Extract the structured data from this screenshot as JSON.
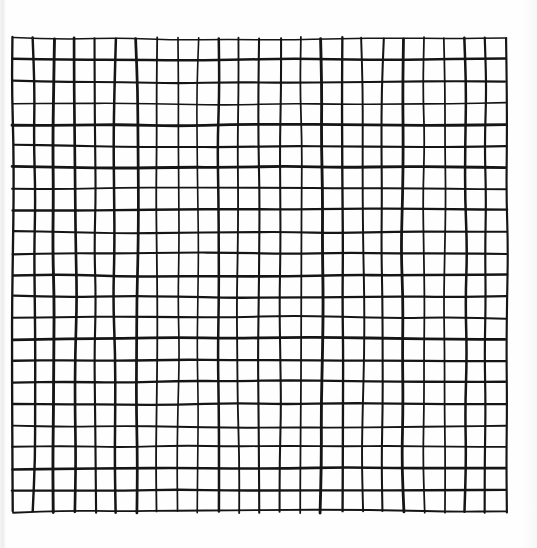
{
  "artwork": {
    "title": "Hand-drawn grid",
    "description": "A freehand ink drawing of a rectangular lattice of nearly-square cells on white paper",
    "medium": "ink on paper",
    "canvas": {
      "width": 537,
      "height": 548,
      "background_color": "#ffffff"
    },
    "paper": {
      "color": "#fefefe",
      "left_edge_shadow_color": "#e9e9e9",
      "right_edge_shadow_color": "#f7f7f7"
    }
  },
  "grid": {
    "name": "hand-drawn-lattice",
    "columns": 24,
    "rows": 22,
    "vertical_line_count": 25,
    "horizontal_line_count": 23,
    "bounds": {
      "x": 13,
      "y": 38,
      "width": 493,
      "height": 474
    },
    "cell_width": 20.54,
    "cell_height": 21.55,
    "ink_color": "#151515",
    "stroke_width_min": 1.5,
    "stroke_width_max": 2.9,
    "wobble_amplitude_px": 2.0,
    "wobble_segments": 9,
    "style": "freehand"
  },
  "chart_data": {
    "type": "heatmap",
    "xlabel": "",
    "ylabel": "",
    "grid": true,
    "legend": "none",
    "categories": [],
    "values": [],
    "axis_ranges": {
      "x": [
        0,
        24
      ],
      "y": [
        0,
        22
      ]
    },
    "annotations": []
  }
}
